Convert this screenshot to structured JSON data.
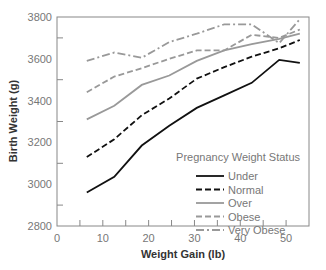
{
  "chart_data": {
    "type": "line",
    "title": "",
    "xlabel": "Weight Gain (lb)",
    "ylabel": "Birth Weight (g)",
    "xlim": [
      0,
      55
    ],
    "ylim": [
      2800,
      3800
    ],
    "x_ticks": [
      0,
      10,
      20,
      30,
      40,
      50
    ],
    "y_ticks": [
      2800,
      3000,
      3200,
      3400,
      3600,
      3800
    ],
    "grid": false,
    "legend": {
      "title": "Pregnancy Weight Status",
      "position": "lower right inside"
    },
    "x": [
      6.5,
      12.5,
      18.5,
      24.5,
      30.5,
      36.5,
      42.5,
      48.5,
      53
    ],
    "series": [
      {
        "name": "Under",
        "color": "#111111",
        "dash": "solid",
        "values": [
          2960,
          3035,
          3185,
          3280,
          3365,
          3425,
          3485,
          3595,
          3580
        ]
      },
      {
        "name": "Normal",
        "color": "#111111",
        "dash": "dashed",
        "values": [
          3130,
          3215,
          3330,
          3410,
          3505,
          3560,
          3610,
          3650,
          3690
        ]
      },
      {
        "name": "Over",
        "color": "#999999",
        "dash": "solid",
        "values": [
          3310,
          3375,
          3475,
          3520,
          3590,
          3640,
          3670,
          3695,
          3720
        ]
      },
      {
        "name": "Obese",
        "color": "#999999",
        "dash": "dashed",
        "values": [
          3440,
          3515,
          3555,
          3600,
          3640,
          3640,
          3715,
          3700,
          3740
        ]
      },
      {
        "name": "Very Obese",
        "color": "#999999",
        "dash": "dashdot",
        "values": [
          3590,
          3630,
          3605,
          3680,
          3720,
          3765,
          3765,
          3675,
          3790
        ]
      }
    ]
  }
}
